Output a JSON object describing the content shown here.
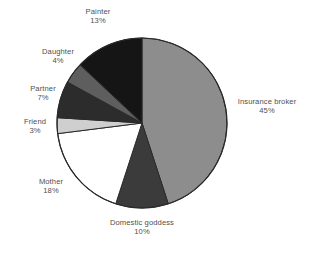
{
  "chart_data": {
    "type": "pie",
    "title": "",
    "subtitle": "",
    "xlabel": "",
    "ylabel": "",
    "legend_position": "none",
    "grid": false,
    "labels_show_percent": true,
    "start_angle_deg": 0,
    "direction": "clockwise",
    "total": 100,
    "unit": "%",
    "categories": [
      "Insurance broker",
      "Domestic goddess",
      "Mother",
      "Friend",
      "Partner",
      "Daughter",
      "Painter"
    ],
    "values": [
      45,
      10,
      18,
      3,
      7,
      4,
      13
    ],
    "slices": [
      {
        "id": "insurance-broker",
        "label": "Insurance broker",
        "value": 45,
        "percent_text": "45%",
        "color": "#8d8d8d"
      },
      {
        "id": "domestic-goddess",
        "label": "Domestic goddess",
        "value": 10,
        "percent_text": "10%",
        "color": "#3b3b3b"
      },
      {
        "id": "mother",
        "label": "Mother",
        "value": 18,
        "percent_text": "18%",
        "color": "#ffffff"
      },
      {
        "id": "friend",
        "label": "Friend",
        "value": 3,
        "percent_text": "3%",
        "color": "#cfcfcf"
      },
      {
        "id": "partner",
        "label": "Partner",
        "value": 7,
        "percent_text": "7%",
        "color": "#2c2c2c"
      },
      {
        "id": "daughter",
        "label": "Daughter",
        "value": 4,
        "percent_text": "4%",
        "color": "#5e5e5e"
      },
      {
        "id": "painter",
        "label": "Painter",
        "value": 13,
        "percent_text": "13%",
        "color": "#151515"
      }
    ],
    "outline_color": "#2a2a2a",
    "label_color": "#4f4f4f",
    "background_color": "#ffffff"
  }
}
